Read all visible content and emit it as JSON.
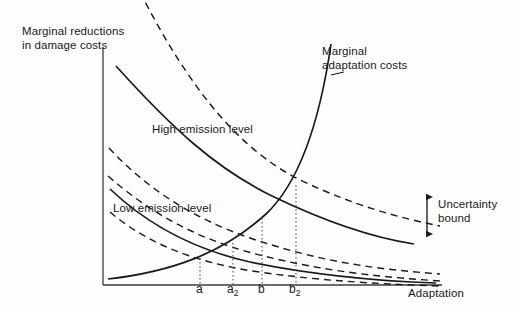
{
  "figure": {
    "type": "economics-schematic-diagram",
    "background_color": "#fdfdfd",
    "line_color": "#1a1a1a"
  },
  "axes": {
    "y_title_line1": "Marginal reductions",
    "y_title_line2": "in damage costs",
    "x_title": "Adaptation",
    "x_axis": {
      "x_start": 103,
      "x_end": 442,
      "y": 285
    },
    "y_axis": {
      "x": 103,
      "y_start": 47,
      "y_end": 285
    }
  },
  "annotations": {
    "marginal_adaptation_costs_line1": "Marginal",
    "marginal_adaptation_costs_line2": "adaptation costs",
    "high_emission": "High emission level",
    "low_emission": "Low emission level",
    "uncertainty_line1": "Uncertainty",
    "uncertainty_line2": "bound"
  },
  "tick_labels": [
    {
      "id": "a",
      "base": "a",
      "sub": "",
      "x": 200
    },
    {
      "id": "a2",
      "base": "a",
      "sub": "2",
      "x": 233
    },
    {
      "id": "b",
      "base": "b",
      "sub": "",
      "x": 262
    },
    {
      "id": "b2",
      "base": "b",
      "sub": "2",
      "x": 296
    }
  ],
  "chart_data": {
    "type": "line",
    "title": "",
    "xlabel": "Adaptation",
    "ylabel": "Marginal reductions in damage costs",
    "grid": false,
    "legend": "inline-annotations",
    "xlim": [
      103,
      442
    ],
    "ylim": [
      285,
      40
    ],
    "note": "Schematic: downward-sloping marginal damage-reduction curves for two emission levels, each bracketed by an uncertainty band of dashed curves; an upward-sloping marginal adaptation cost curve intersects them at a, a2, b, b2.",
    "series": [
      {
        "name": "High emission level - upper uncertainty bound",
        "style": "dashed",
        "path": "M 140,-8 C 190,90 240,150 300,180 C 355,206 400,218 440,226"
      },
      {
        "name": "High emission level",
        "style": "solid",
        "path": "M 116,66 C 172,128 215,168 272,196 C 330,224 375,238 414,244"
      },
      {
        "name": "High emission level - lower uncertainty bound",
        "style": "dashed",
        "path": "M 109,148 C 146,188 192,218 250,238 C 318,261 372,269 440,274"
      },
      {
        "name": "Low emission level - upper uncertainty bound",
        "style": "dashed",
        "path": "M 108,176 C 150,213 196,238 252,253 C 320,271 380,277 440,281"
      },
      {
        "name": "Low emission level",
        "style": "solid",
        "path": "M 110,189 C 150,227 196,250 250,262 C 318,276 378,281 436,283"
      },
      {
        "name": "Low emission level - lower uncertainty bound",
        "style": "dashed",
        "path": "M 110,212 C 150,246 198,262 252,271 C 320,281 380,284 440,286"
      },
      {
        "name": "Marginal adaptation costs",
        "style": "solid",
        "path": "M 108,279 C 170,272 222,254 266,214 C 300,182 320,120 331,44"
      }
    ],
    "intersections": [
      {
        "label": "a",
        "x": 200,
        "y": 258,
        "meets": "Low emission level"
      },
      {
        "label": "a2",
        "x": 233,
        "y": 243,
        "meets": "Low emission level - upper uncertainty bound"
      },
      {
        "label": "b",
        "x": 262,
        "y": 218,
        "meets": "High emission level - lower uncertainty bound"
      },
      {
        "label": "b2",
        "x": 296,
        "y": 185,
        "meets": "High emission level"
      }
    ],
    "uncertainty_bound_marker": {
      "x": 427,
      "y_top": 195,
      "y_bottom": 236
    }
  }
}
